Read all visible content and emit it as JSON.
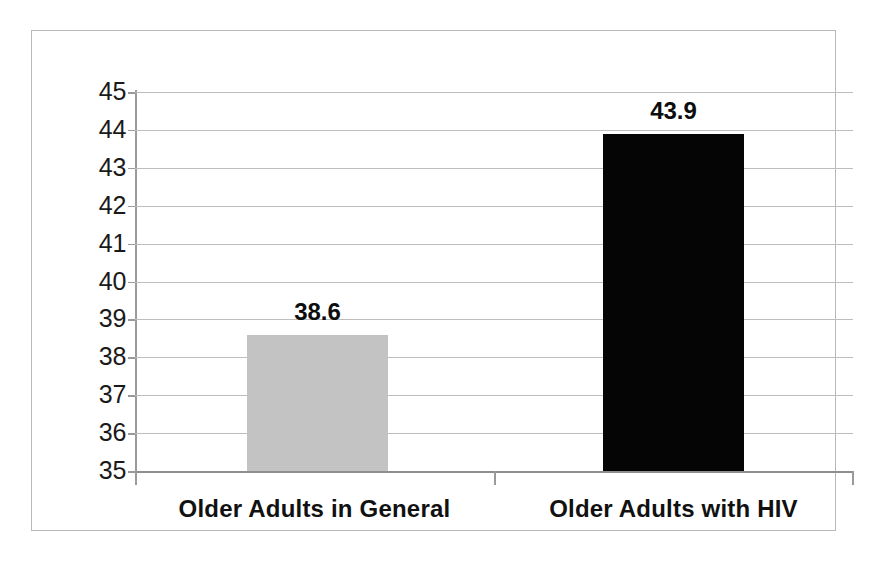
{
  "chart_data": {
    "type": "bar",
    "title": "",
    "subtitle": "",
    "xlabel": "",
    "ylabel": "",
    "categories": [
      "Older Adults in General",
      "Older Adults with HIV"
    ],
    "values": [
      38.6,
      43.9
    ],
    "value_labels": [
      "38.6",
      "43.9"
    ],
    "series": [
      {
        "name": "",
        "values": [
          38.6,
          43.9
        ],
        "colors": [
          "#c3c3c3",
          "#050505"
        ]
      }
    ],
    "ylim": [
      35,
      45
    ],
    "ytick_step": 1,
    "ytick_labels": [
      "45",
      "44",
      "43",
      "42",
      "41",
      "40",
      "39",
      "38",
      "37",
      "36",
      "35"
    ],
    "ytick_values": [
      45,
      44,
      43,
      42,
      41,
      40,
      39,
      38,
      37,
      36,
      35
    ],
    "grid": true,
    "grid_axis": "y",
    "legend": false,
    "legend_position": "none",
    "annotations": []
  },
  "colors": {
    "bar_general": "#c3c3c3",
    "bar_hiv": "#050505",
    "gridline": "#bdbdbd",
    "axis": "#9a9a9a",
    "frame": "#b9b9b9",
    "text": "#111111"
  }
}
